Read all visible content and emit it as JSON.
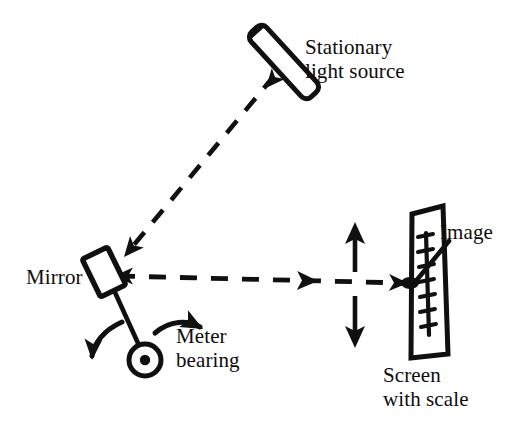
{
  "figure": {
    "kind": "optical-lever-diagram",
    "background_color": "#ffffff",
    "ink_color": "#101010",
    "width": 530,
    "height": 427
  },
  "labels": {
    "light_source": "Stationary\nlight source",
    "mirror": "Mirror",
    "meter_bearing": "Meter\nbearing",
    "screen": "Screen\nwith scale",
    "image": "Image"
  },
  "components": {
    "light_source": {
      "name": "light-source-tube",
      "description": "slender cylindrical lamp tilted about 45 degrees pointing down-left"
    },
    "mirror": {
      "name": "mirror-plate",
      "description": "small tilted rectangular mirror mounted on a stem"
    },
    "bearing": {
      "name": "meter-bearing",
      "description": "circle with centered dot marking the rotation axis out of the page"
    },
    "screen": {
      "name": "screen-with-scale",
      "description": "tall skewed rectangular screen carrying a vertical graduated scale",
      "scale_tick_count": 8
    },
    "image_spot": {
      "name": "image-spot",
      "description": "bright reflected spot on the screen scale"
    }
  },
  "beams": {
    "incident": {
      "name": "incident-beam",
      "style": "dashed",
      "direction": "from light source down-left to mirror",
      "arrow_count": 2
    },
    "reflected": {
      "name": "reflected-beam",
      "style": "dashed",
      "direction": "from mirror horizontally right to screen",
      "arrow_count": 3
    }
  },
  "motion": {
    "mirror_rotation": {
      "name": "rotation-arrows",
      "description": "two curved arrows indicating the mirror rocking about the bearing"
    },
    "spot_travel": {
      "name": "spot-travel-arrows",
      "description": "vertical up and down arrows showing the image spot sweeping along the scale"
    }
  }
}
